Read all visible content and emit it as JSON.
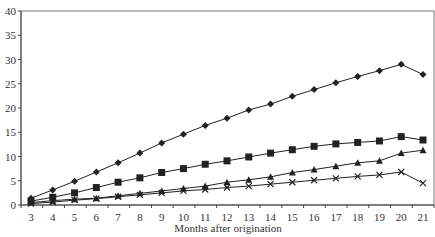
{
  "chart_data": {
    "type": "line",
    "title": "",
    "xlabel": "Months after origination",
    "ylabel": "",
    "x": [
      3,
      4,
      5,
      6,
      7,
      8,
      9,
      10,
      11,
      12,
      13,
      14,
      15,
      16,
      17,
      18,
      19,
      20,
      21
    ],
    "ylim": [
      0,
      40
    ],
    "yticks": [
      0,
      5,
      10,
      15,
      20,
      25,
      30,
      35,
      40
    ],
    "grid": false,
    "legend": "none",
    "series": [
      {
        "name": "series-diamond",
        "marker": "diamond",
        "values": [
          1.4,
          3.1,
          4.9,
          6.8,
          8.7,
          10.7,
          12.8,
          14.6,
          16.4,
          17.9,
          19.6,
          20.8,
          22.4,
          23.8,
          25.2,
          26.5,
          27.7,
          29.0,
          26.9
        ]
      },
      {
        "name": "series-square",
        "marker": "square",
        "values": [
          0.8,
          1.6,
          2.5,
          3.6,
          4.7,
          5.6,
          6.7,
          7.5,
          8.4,
          9.1,
          9.9,
          10.7,
          11.4,
          12.1,
          12.6,
          12.9,
          13.2,
          14.1,
          13.4
        ]
      },
      {
        "name": "series-triangle",
        "marker": "triangle",
        "values": [
          0.5,
          0.9,
          1.2,
          1.4,
          1.9,
          2.4,
          2.9,
          3.4,
          3.9,
          4.7,
          5.2,
          5.8,
          6.7,
          7.3,
          8.0,
          8.7,
          9.1,
          10.7,
          11.3
        ]
      },
      {
        "name": "series-x",
        "marker": "x",
        "values": [
          0.3,
          0.6,
          1.0,
          1.3,
          1.7,
          2.1,
          2.5,
          2.9,
          3.2,
          3.6,
          3.9,
          4.3,
          4.7,
          5.1,
          5.5,
          5.9,
          6.2,
          6.8,
          4.5
        ]
      }
    ]
  },
  "colors": {
    "line": "#222222",
    "axis": "#444444"
  }
}
